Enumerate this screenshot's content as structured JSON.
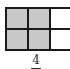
{
  "diagram": {
    "type": "fraction-area-model",
    "rows": 2,
    "columns_visible": 3,
    "cells": [
      {
        "row": 0,
        "col": 0,
        "shaded": true
      },
      {
        "row": 0,
        "col": 1,
        "shaded": true
      },
      {
        "row": 0,
        "col": 2,
        "shaded": false
      },
      {
        "row": 1,
        "col": 0,
        "shaded": true
      },
      {
        "row": 1,
        "col": 1,
        "shaded": true
      },
      {
        "row": 1,
        "col": 2,
        "shaded": false
      }
    ],
    "shaded_color": "#c8c8c8",
    "unshaded_color": "#ffffff",
    "line_color": "#1a1a1a"
  },
  "fraction": {
    "numerator": "4"
  }
}
